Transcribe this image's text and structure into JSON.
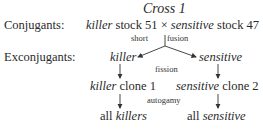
{
  "title": "Cross 1",
  "rows": {
    "conjugants": {
      "label": "Conjugants:",
      "left_type": "killer",
      "left_rest": " stock 51 ",
      "cross": "×",
      "right_type": "sensitive",
      "right_rest": " stock 47"
    },
    "process1": {
      "left": "short",
      "right": "fusion"
    },
    "exconjugants": {
      "label": "Exconjugants:",
      "left": "killer",
      "right": "sensitive"
    },
    "process2": "fission",
    "clones": {
      "left_type": "killer",
      "left_rest": " clone 1",
      "right_type": "sensitive",
      "right_rest": " clone 2"
    },
    "process3": "autogamy",
    "results": {
      "left_pre": "all ",
      "left_type": "killers",
      "right_pre": "all ",
      "right_type": "sensitive"
    }
  }
}
